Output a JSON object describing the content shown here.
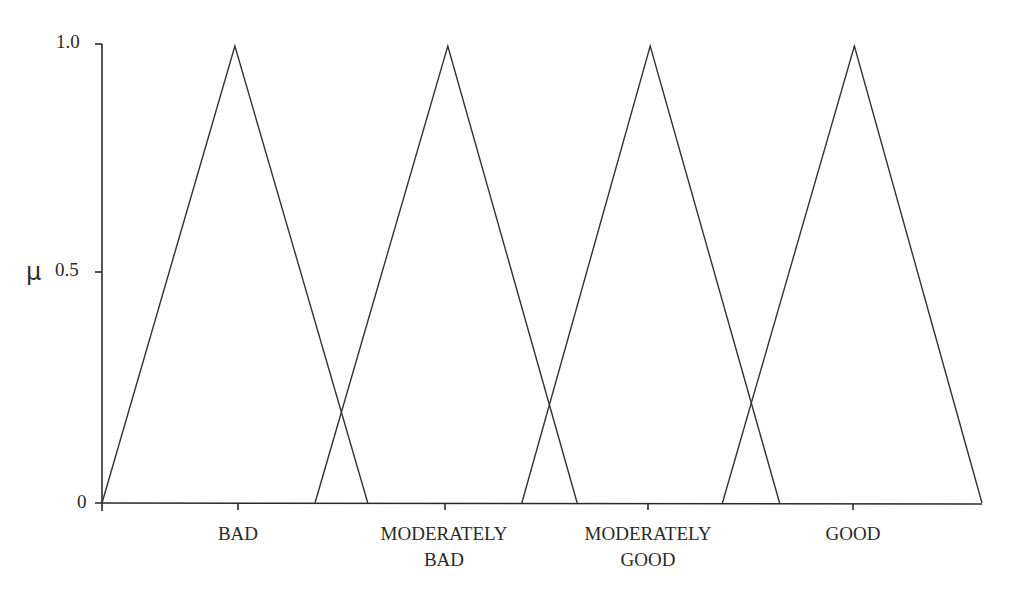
{
  "chart_data": {
    "type": "line",
    "title": "",
    "xlabel": "",
    "ylabel": "μ",
    "ylim": [
      0,
      1.0
    ],
    "y_ticks": [
      "0",
      "0.5",
      "1.0"
    ],
    "x_range_normalized": [
      0,
      1
    ],
    "grid": false,
    "legend": "none",
    "series": [
      {
        "name": "BAD",
        "label_lines": [
          "BAD"
        ],
        "shape": "triangle",
        "points_normalized": [
          [
            0.0,
            0
          ],
          [
            0.151,
            1.0
          ],
          [
            0.302,
            0
          ]
        ]
      },
      {
        "name": "MODERATELY BAD",
        "label_lines": [
          "MODERATELY",
          "BAD"
        ],
        "shape": "triangle",
        "points_normalized": [
          [
            0.242,
            0
          ],
          [
            0.393,
            1.0
          ],
          [
            0.54,
            0
          ]
        ]
      },
      {
        "name": "MODERATELY GOOD",
        "label_lines": [
          "MODERATELY",
          "GOOD"
        ],
        "shape": "triangle",
        "points_normalized": [
          [
            0.477,
            0
          ],
          [
            0.623,
            1.0
          ],
          [
            0.77,
            0
          ]
        ]
      },
      {
        "name": "GOOD",
        "label_lines": [
          "GOOD"
        ],
        "shape": "triangle",
        "points_normalized": [
          [
            0.705,
            0
          ],
          [
            0.855,
            1.0
          ],
          [
            1.0,
            0
          ]
        ]
      }
    ],
    "intersections_mu_approx": [
      0.2,
      0.22,
      0.21
    ]
  },
  "axis": {
    "y_label": "μ",
    "y_tick_0": "0",
    "y_tick_05": "0.5",
    "y_tick_1": "1.0"
  },
  "labels": {
    "bad": [
      "BAD"
    ],
    "moderately_bad": [
      "MODERATELY",
      "BAD"
    ],
    "moderately_good": [
      "MODERATELY",
      "GOOD"
    ],
    "good": [
      "GOOD"
    ]
  },
  "style": {
    "line_color": "#333333",
    "axis_color": "#2a2a2a",
    "background": "#ffffff"
  }
}
